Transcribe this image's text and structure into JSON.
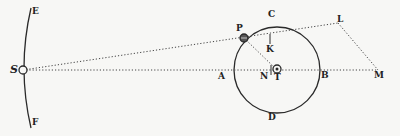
{
  "diagram": {
    "type": "geometric figure (orbit of body P around T, with distant body S)",
    "labels": {
      "E": "E",
      "F": "F",
      "S": "S",
      "P": "P",
      "C": "C",
      "K": "K",
      "A": "A",
      "N": "N",
      "T": "T",
      "B": "B",
      "D": "D",
      "L": "L",
      "M": "M"
    },
    "points": {
      "S": [
        23,
        70
      ],
      "P": [
        244,
        38
      ],
      "K": [
        270,
        40
      ],
      "T": [
        277,
        70
      ],
      "L": [
        338,
        23
      ],
      "M": [
        378,
        70
      ],
      "A": [
        234,
        70
      ],
      "B": [
        320,
        70
      ]
    },
    "circle": {
      "center": "T",
      "radius": 43
    },
    "lines": [
      {
        "from": "S",
        "to": "L",
        "style": "dotted"
      },
      {
        "from": "S",
        "to": "M",
        "style": "dotted"
      },
      {
        "from": "P",
        "to": "T",
        "style": "dotted"
      },
      {
        "from": "L",
        "to": "M",
        "style": "dotted"
      }
    ],
    "arc": {
      "from": "E",
      "to": "F",
      "through": "S"
    },
    "colors": {
      "ink": "#2a2a2a",
      "paper": "#f7f7f5"
    }
  }
}
